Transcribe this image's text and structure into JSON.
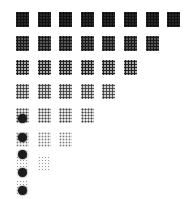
{
  "pattern_grid": {
    "rows": [
      {
        "count": 8,
        "density": "d0"
      },
      {
        "count": 7,
        "density": "d1"
      },
      {
        "count": 6,
        "density": "d2"
      },
      {
        "count": 5,
        "density": "d3"
      },
      {
        "count": 4,
        "density": "d4"
      },
      {
        "count": 3,
        "density": "d5"
      },
      {
        "count": 2,
        "density": "d6"
      },
      {
        "count": 1,
        "density": "d6"
      }
    ],
    "origin_x": 16,
    "origin_y": 12,
    "pitch_x": 21.6,
    "pitch_y": 24,
    "blobs": [
      {
        "x": 18,
        "y": 114
      },
      {
        "x": 18,
        "y": 133
      },
      {
        "x": 18,
        "y": 150
      },
      {
        "x": 18,
        "y": 168
      },
      {
        "x": 18,
        "y": 186
      }
    ]
  }
}
